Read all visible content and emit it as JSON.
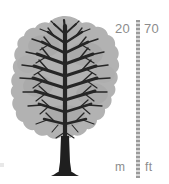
{
  "figure": {
    "tree": {
      "name": "deciduous-tree",
      "foliage_color": "#b2b2b2",
      "branch_color": "#262626",
      "trunk_color": "#1f1f1f"
    }
  },
  "scale": {
    "bar_color": "#9a9a9a",
    "label_color": "#8c8c8c",
    "metric": {
      "value": "20",
      "unit": "m"
    },
    "imperial": {
      "value": "70",
      "unit": "ft"
    }
  }
}
